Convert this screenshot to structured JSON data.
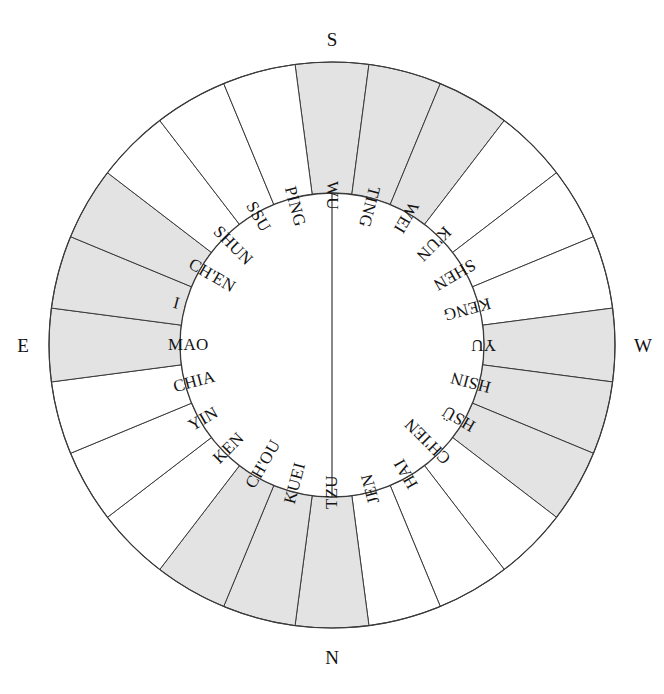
{
  "figure": {
    "type": "radial-dial-diagram",
    "title": "",
    "center": {
      "x": 332,
      "y": 345
    },
    "radii": {
      "inner": 152,
      "outer": 283
    },
    "colors": {
      "shaded_sector": "#e3e3e3",
      "plain_sector": "#ffffff",
      "stroke": "#3a3a3a",
      "text": "#141414",
      "background": "#ffffff"
    },
    "sector_count": 24,
    "sector_span_degrees": 15,
    "start_angle_degrees": -7.5
  },
  "cardinals": {
    "top": "S",
    "right": "W",
    "bottom": "N",
    "left": "E"
  },
  "sectors": [
    {
      "label": "WU",
      "shaded": true,
      "index": 0
    },
    {
      "label": "TING",
      "shaded": true,
      "index": 1
    },
    {
      "label": "WEI",
      "shaded": true,
      "index": 2
    },
    {
      "label": "K'UN",
      "shaded": false,
      "index": 3
    },
    {
      "label": "SHEN",
      "shaded": false,
      "index": 4
    },
    {
      "label": "KENG",
      "shaded": false,
      "index": 5
    },
    {
      "label": "YU",
      "shaded": true,
      "index": 6
    },
    {
      "label": "HSIN",
      "shaded": true,
      "index": 7
    },
    {
      "label": "HSÜ",
      "shaded": true,
      "index": 8
    },
    {
      "label": "CH'IEN",
      "shaded": false,
      "index": 9
    },
    {
      "label": "HAI",
      "shaded": false,
      "index": 10
    },
    {
      "label": "JEN",
      "shaded": false,
      "index": 11
    },
    {
      "label": "TZU",
      "shaded": true,
      "index": 12
    },
    {
      "label": "KUEI",
      "shaded": true,
      "index": 13
    },
    {
      "label": "CH'OU",
      "shaded": true,
      "index": 14
    },
    {
      "label": "KEN",
      "shaded": false,
      "index": 15
    },
    {
      "label": "YIN",
      "shaded": false,
      "index": 16
    },
    {
      "label": "CHIA",
      "shaded": false,
      "index": 17
    },
    {
      "label": "MAO",
      "shaded": true,
      "index": 18
    },
    {
      "label": "I",
      "shaded": true,
      "index": 19
    },
    {
      "label": "CH'EN",
      "shaded": true,
      "index": 20
    },
    {
      "label": "SHUN",
      "shaded": false,
      "index": 21
    },
    {
      "label": "SSU",
      "shaded": false,
      "index": 22
    },
    {
      "label": "PING",
      "shaded": false,
      "index": 23
    }
  ],
  "chart_data": {
    "type": "pie",
    "title": "",
    "categories": [
      "WU",
      "TING",
      "WEI",
      "K'UN",
      "SHEN",
      "KENG",
      "YU",
      "HSIN",
      "HSÜ",
      "CH'IEN",
      "HAI",
      "JEN",
      "TZU",
      "KUEI",
      "CH'OU",
      "KEN",
      "YIN",
      "CHIA",
      "MAO",
      "I",
      "CH'EN",
      "SHUN",
      "SSU",
      "PING"
    ],
    "values": [
      15,
      15,
      15,
      15,
      15,
      15,
      15,
      15,
      15,
      15,
      15,
      15,
      15,
      15,
      15,
      15,
      15,
      15,
      15,
      15,
      15,
      15,
      15,
      15
    ],
    "xlabel": "",
    "ylabel": "",
    "legend": "none",
    "annotations": [
      "S",
      "W",
      "N",
      "E"
    ]
  }
}
